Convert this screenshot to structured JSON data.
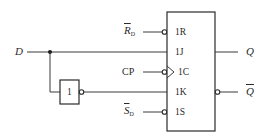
{
  "diagram": {
    "type": "D flip-flop built from JK flip-flop",
    "input": {
      "label": "D"
    },
    "inverter": {
      "label": "1"
    },
    "flipflop": {
      "pins": {
        "reset": "1R",
        "j": "1J",
        "clock": "1C",
        "k": "1K",
        "set": "1S"
      }
    },
    "external_inputs": {
      "reset": {
        "main": "R",
        "sub": "D",
        "inverted": true
      },
      "clock": {
        "label": "CP"
      },
      "set": {
        "main": "S",
        "sub": "D",
        "inverted": true
      }
    },
    "outputs": {
      "q": "Q",
      "q_bar": "Q"
    },
    "colors": {
      "line": "#3a3a3a",
      "text": "#2a2a2a",
      "background": "#ffffff"
    }
  }
}
